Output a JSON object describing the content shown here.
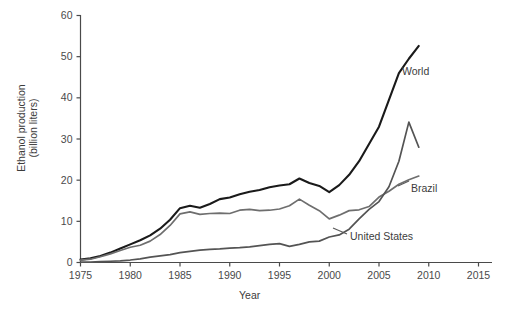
{
  "chart_data": {
    "type": "line",
    "title": "",
    "xlabel": "Year",
    "ylabel": "Ethanol production (billion liters)",
    "xlim": [
      1975,
      2015
    ],
    "ylim": [
      0,
      60
    ],
    "grid": false,
    "legend_position": "inline-end-of-line",
    "xticks": [
      "1975",
      "1980",
      "1985",
      "1990",
      "1995",
      "2000",
      "2005",
      "2010",
      "2015"
    ],
    "yticks": [
      "0",
      "10",
      "20",
      "30",
      "40",
      "50",
      "60"
    ],
    "x": [
      1975,
      1976,
      1977,
      1978,
      1979,
      1980,
      1981,
      1982,
      1983,
      1984,
      1985,
      1986,
      1987,
      1988,
      1989,
      1990,
      1991,
      1992,
      1993,
      1994,
      1995,
      1996,
      1997,
      1998,
      1999,
      2000,
      2001,
      2002,
      2003,
      2004,
      2005,
      2006,
      2007,
      2008,
      2009
    ],
    "series": [
      {
        "name": "World",
        "color": "#1a1a1a",
        "values": [
          0.7,
          1.0,
          1.6,
          2.4,
          3.4,
          4.4,
          5.4,
          6.6,
          8.2,
          10.4,
          13.2,
          13.8,
          13.3,
          14.2,
          15.4,
          15.8,
          16.6,
          17.2,
          17.6,
          18.3,
          18.7,
          19.0,
          20.4,
          19.3,
          18.6,
          17.1,
          18.8,
          21.3,
          24.6,
          28.8,
          33.0,
          39.5,
          46.0,
          49.5,
          52.6
        ]
      },
      {
        "name": "Brazil",
        "color": "#6e6e6e",
        "values": [
          0.6,
          0.8,
          1.4,
          2.1,
          2.9,
          3.7,
          4.2,
          5.2,
          6.8,
          9.0,
          11.8,
          12.3,
          11.7,
          11.9,
          12.0,
          11.9,
          12.7,
          12.9,
          12.6,
          12.7,
          13.0,
          13.8,
          15.4,
          13.9,
          12.6,
          10.6,
          11.5,
          12.6,
          12.8,
          13.6,
          15.9,
          17.3,
          19.0,
          20.1,
          21.0
        ]
      },
      {
        "name": "United States",
        "color": "#545454",
        "values": [
          0.1,
          0.1,
          0.2,
          0.3,
          0.4,
          0.6,
          0.9,
          1.3,
          1.6,
          1.9,
          2.4,
          2.7,
          3.0,
          3.2,
          3.3,
          3.5,
          3.6,
          3.8,
          4.1,
          4.4,
          4.6,
          3.9,
          4.4,
          5.0,
          5.2,
          6.2,
          6.7,
          8.1,
          10.6,
          12.9,
          14.8,
          18.4,
          24.6,
          34.1,
          28.0
        ]
      }
    ],
    "annotations": [
      {
        "text": "World",
        "series": "World"
      },
      {
        "text": "Brazil",
        "series": "Brazil"
      },
      {
        "text": "United States",
        "series": "United States"
      }
    ]
  }
}
